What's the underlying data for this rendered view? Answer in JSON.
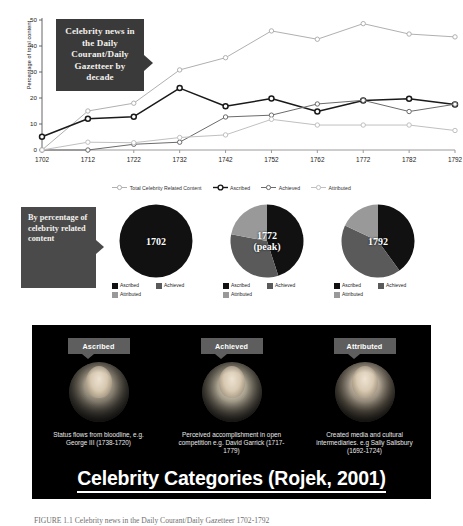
{
  "chart_data": {
    "type": "line",
    "title": "Celebrity news in the Daily Courant/Daily Gazetteer by decade",
    "xlabel": "",
    "ylabel": "Percentage of total content",
    "ylim": [
      0,
      50
    ],
    "yticks": [
      0,
      10,
      20,
      30,
      40,
      50
    ],
    "grid": false,
    "legend_position": "bottom",
    "categories": [
      "1702",
      "1712",
      "1722",
      "1732",
      "1742",
      "1752",
      "1762",
      "1772",
      "1782",
      "1792"
    ],
    "series": [
      {
        "name": "Total Celebrity Related Content",
        "color": "#b0b0b0",
        "values": [
          0,
          15.0,
          18.0,
          30.8,
          35.5,
          45.8,
          42.6,
          48.6,
          44.6,
          43.5
        ]
      },
      {
        "name": "Ascribed",
        "color": "#1a1a1a",
        "values": [
          5.1,
          12.0,
          12.8,
          23.8,
          16.8,
          19.8,
          14.8,
          19.0,
          19.7,
          17.5
        ]
      },
      {
        "name": "Achieved",
        "color": "#6b6b6b",
        "values": [
          0,
          0,
          2.2,
          3.0,
          12.7,
          13.4,
          17.7,
          19.1,
          14.8,
          17.6
        ]
      },
      {
        "name": "Attributed",
        "color": "#c0c0c0",
        "values": [
          0,
          3.0,
          2.8,
          4.8,
          5.8,
          11.8,
          9.6,
          9.6,
          9.6,
          7.5
        ]
      }
    ]
  },
  "chart": {
    "callout_text": "Celebrity news in the Daily Courant/Daily Gazetteer by decade",
    "ylabel": "Percentage of total content",
    "legend": [
      {
        "label": "Total Celebrity Related Content",
        "color": "#b0b0b0",
        "bold": false
      },
      {
        "label": "Ascribed",
        "color": "#1a1a1a",
        "bold": true
      },
      {
        "label": "Achieved",
        "color": "#6b6b6b",
        "bold": false
      },
      {
        "label": "Attributed",
        "color": "#c0c0c0",
        "bold": false
      }
    ]
  },
  "pies_section": {
    "callout_text": "By percentage of celebrity related content",
    "legend_labels": {
      "ascribed": "Ascribed",
      "achieved": "Achieved",
      "attributed": "Attributed"
    },
    "colors": {
      "ascribed": "#111111",
      "achieved": "#5a5a5a",
      "attributed": "#999999"
    },
    "pies": [
      {
        "label": "1702",
        "sublabel": "",
        "slices": {
          "ascribed": 100,
          "achieved": 0,
          "attributed": 0
        }
      },
      {
        "label": "1772",
        "sublabel": "(peak)",
        "slices": {
          "ascribed": 45,
          "achieved": 33,
          "attributed": 22
        }
      },
      {
        "label": "1792",
        "sublabel": "",
        "slices": {
          "ascribed": 40,
          "achieved": 42,
          "attributed": 18
        }
      }
    ]
  },
  "panel": {
    "title": "Celebrity Categories (Rojek, 2001)",
    "cards": [
      {
        "tag": "Ascribed",
        "desc": "Status flows from bloodline, e.g. George III (1738-1720)"
      },
      {
        "tag": "Achieved",
        "desc": "Perceived accomplishment in open competition e.g. David Garrick (1717-1779)"
      },
      {
        "tag": "Attributed",
        "desc": "Created media and cultural intermediaries. e.g Sally Salisbury (1692-1724)"
      }
    ]
  },
  "caption": "FIGURE 1.1 Celebrity news in the Daily Courant/Daily Gazetteer 1702-1792"
}
